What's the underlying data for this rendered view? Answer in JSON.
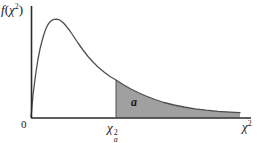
{
  "figure": {
    "labels": {
      "y_axis": {
        "f": "f",
        "open_paren": "(",
        "chi": "χ",
        "sup": "2",
        "close_paren": ")"
      },
      "x_axis": {
        "chi": "χ",
        "sup": "2"
      },
      "origin": "0",
      "critical_value": {
        "chi": "χ",
        "sup": "2",
        "sub": "a"
      },
      "shaded_area": "a"
    }
  },
  "colors": {
    "background": "#ffffff",
    "axis": "#2a2a2a",
    "curve": "#4f4f4f",
    "shaded_fill": "#a0a0a0",
    "text": "#1a1a1a"
  },
  "chart_data": {
    "type": "area",
    "title": "",
    "xlabel": "χ2",
    "ylabel": "f(χ2)",
    "legend": "none",
    "grid": false,
    "shaded_region": {
      "from_label": "χ2_a",
      "area_label": "a"
    },
    "geometry": {
      "y_axis": {
        "x": 31.5,
        "y_top": 6,
        "y_bottom": 118
      },
      "x_axis": {
        "y": 118,
        "x_left": 31,
        "x_right": 251
      },
      "baseline_y": 117.4,
      "critical_x": 116,
      "curve_end_x": 240,
      "curve_points": [
        [
          31,
          117
        ],
        [
          32,
          106
        ],
        [
          33,
          95
        ],
        [
          34.5,
          83
        ],
        [
          36,
          72
        ],
        [
          38,
          59
        ],
        [
          40,
          49
        ],
        [
          42,
          41
        ],
        [
          44,
          34
        ],
        [
          46,
          28.5
        ],
        [
          48,
          24.5
        ],
        [
          50,
          21.8
        ],
        [
          52,
          20.2
        ],
        [
          54,
          19.4
        ],
        [
          57,
          19.2
        ],
        [
          60,
          20.2
        ],
        [
          63,
          22.5
        ],
        [
          66,
          25.8
        ],
        [
          70,
          31
        ],
        [
          74,
          37
        ],
        [
          78,
          43
        ],
        [
          83,
          50
        ],
        [
          88,
          56.5
        ],
        [
          93,
          62
        ],
        [
          98,
          67
        ],
        [
          104,
          72
        ],
        [
          110,
          76.5
        ],
        [
          116,
          80
        ],
        [
          123,
          84.5
        ],
        [
          130,
          88.5
        ],
        [
          138,
          92.5
        ],
        [
          146,
          96
        ],
        [
          155,
          99.5
        ],
        [
          164,
          102.5
        ],
        [
          174,
          105
        ],
        [
          184,
          107
        ],
        [
          195,
          108.8
        ],
        [
          206,
          110.2
        ],
        [
          218,
          111.3
        ],
        [
          230,
          112.1
        ],
        [
          240,
          112.6
        ]
      ]
    }
  }
}
